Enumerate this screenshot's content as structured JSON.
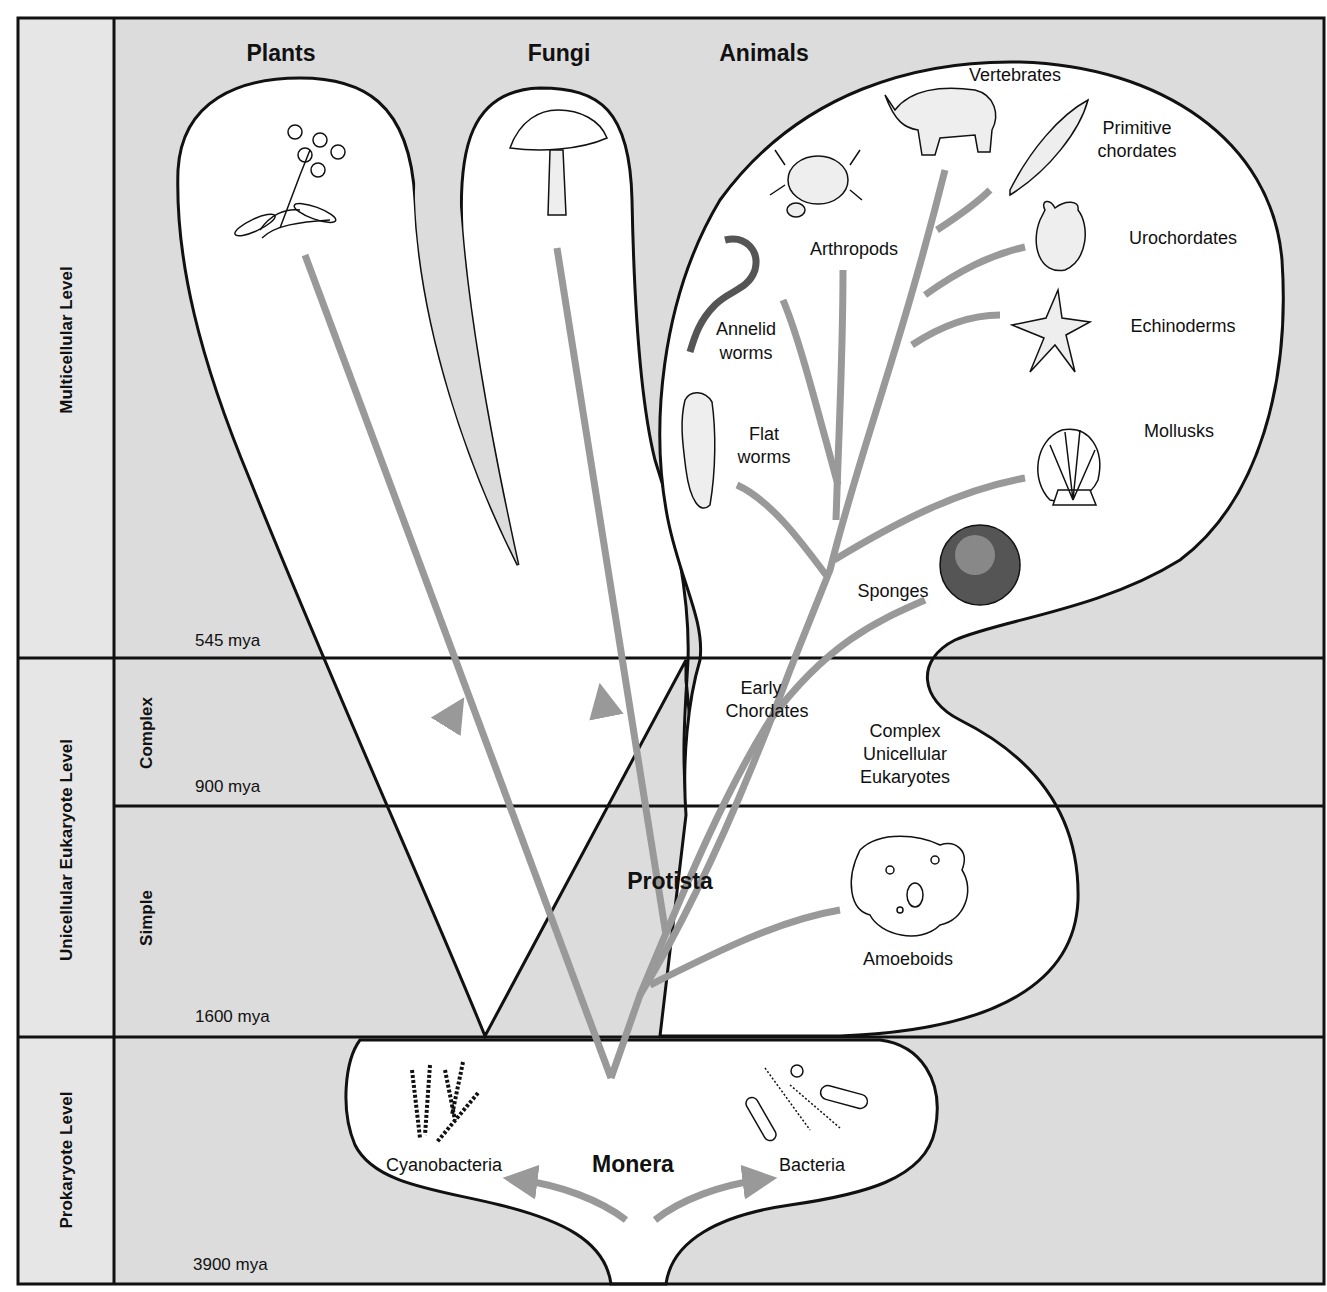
{
  "colors": {
    "background_gray": "#dcdcdc",
    "sidebar_gray": "#e4e4e4",
    "region_white": "#ffffff",
    "branch_gray": "#999999",
    "outline": "#111111"
  },
  "levels": [
    {
      "label": "Multicellular Level"
    },
    {
      "label": "Unicellular Eukaryote Level",
      "sublevels": [
        {
          "label": "Complex"
        },
        {
          "label": "Simple"
        }
      ]
    },
    {
      "label": "Prokaryote Level"
    }
  ],
  "time_marks": [
    {
      "label": "545 mya"
    },
    {
      "label": "900 mya"
    },
    {
      "label": "1600 mya"
    },
    {
      "label": "3900 mya"
    }
  ],
  "kingdoms": {
    "plants": "Plants",
    "fungi": "Fungi",
    "animals": "Animals",
    "protista": "Protista",
    "monera": "Monera"
  },
  "animal_groups": {
    "vertebrates": "Vertebrates",
    "primitive_chordates": [
      "Primitive",
      "chordates"
    ],
    "arthropods": "Arthropods",
    "urochordates": "Urochordates",
    "annelid_worms": [
      "Annelid",
      "worms"
    ],
    "echinoderms": "Echinoderms",
    "flat_worms": [
      "Flat",
      "worms"
    ],
    "mollusks": "Mollusks",
    "sponges": "Sponges",
    "early_chordates": [
      "Early",
      "Chordates"
    ]
  },
  "protist_groups": {
    "complex_unicellular": [
      "Complex",
      "Unicellular",
      "Eukaryotes"
    ],
    "amoeboids": "Amoeboids"
  },
  "monera_groups": {
    "cyanobacteria": "Cyanobacteria",
    "bacteria": "Bacteria"
  },
  "illustrations": [
    "flowering-plant",
    "mushroom",
    "rhinoceros",
    "lancelet",
    "crab-and-beetle",
    "sea-squirt",
    "earthworm",
    "starfish",
    "flatworm",
    "scallop-shell",
    "sponge",
    "amoeba",
    "cyanobacteria-filaments",
    "bacteria-cells"
  ]
}
